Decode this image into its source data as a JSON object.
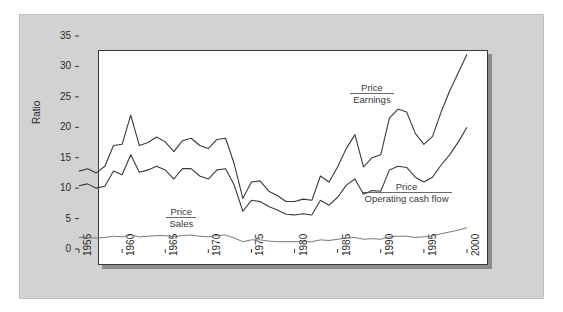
{
  "chart_data": {
    "type": "line",
    "title": "",
    "xlabel": "",
    "ylabel": "Ratio",
    "xlim": [
      1955,
      2000
    ],
    "ylim": [
      0,
      35
    ],
    "grid": false,
    "legend_position": "inline-annotations",
    "yticks": [
      0,
      5,
      10,
      15,
      20,
      25,
      30,
      35
    ],
    "xticks": [
      1955,
      1960,
      1965,
      1970,
      1975,
      1980,
      1985,
      1990,
      1995,
      2000
    ],
    "x": [
      1955,
      1956,
      1957,
      1958,
      1959,
      1960,
      1961,
      1962,
      1963,
      1964,
      1965,
      1966,
      1967,
      1968,
      1969,
      1970,
      1971,
      1972,
      1973,
      1974,
      1975,
      1976,
      1977,
      1978,
      1979,
      1980,
      1981,
      1982,
      1983,
      1984,
      1985,
      1986,
      1987,
      1988,
      1989,
      1990,
      1991,
      1992,
      1993,
      1994,
      1995,
      1996,
      1997,
      1998,
      1999,
      2000
    ],
    "series": [
      {
        "name": "Price / Earnings",
        "label_numerator": "Price",
        "label_denominator": "Earnings",
        "color": "#3a3a3a",
        "values": [
          12.8,
          13.2,
          12.5,
          13.6,
          17.0,
          17.2,
          22.0,
          17.0,
          17.5,
          18.4,
          17.6,
          16.0,
          17.8,
          18.2,
          17.0,
          16.5,
          18.0,
          18.2,
          14.0,
          8.3,
          11.0,
          11.2,
          9.5,
          8.8,
          7.8,
          7.8,
          8.2,
          8.0,
          12.0,
          11.0,
          13.5,
          16.5,
          18.8,
          13.5,
          15.0,
          15.5,
          21.5,
          23.0,
          22.5,
          19.0,
          17.2,
          18.5,
          22.5,
          26.0,
          29.0,
          32.0
        ]
      },
      {
        "name": "Price / Operating cash flow",
        "label_numerator": "Price",
        "label_denominator": "Operating cash flow",
        "color": "#3a3a3a",
        "values": [
          10.4,
          10.7,
          10.0,
          10.3,
          12.8,
          12.2,
          15.5,
          12.6,
          13.0,
          13.6,
          13.0,
          11.5,
          13.2,
          13.2,
          12.0,
          11.5,
          13.0,
          13.2,
          10.5,
          6.2,
          8.0,
          7.8,
          7.0,
          6.4,
          5.7,
          5.6,
          5.8,
          5.6,
          8.0,
          7.2,
          8.5,
          10.5,
          11.5,
          9.0,
          9.6,
          9.5,
          13.0,
          13.6,
          13.4,
          11.8,
          11.0,
          11.8,
          13.8,
          15.5,
          17.6,
          20.0
        ]
      },
      {
        "name": "Price / Sales",
        "label_numerator": "Price",
        "label_denominator": "Sales",
        "color": "#6a6a6a",
        "values": [
          1.9,
          1.9,
          1.8,
          1.9,
          2.1,
          2.0,
          2.3,
          2.0,
          2.1,
          2.2,
          2.2,
          2.0,
          2.2,
          2.3,
          2.1,
          2.0,
          2.2,
          2.3,
          1.8,
          1.2,
          1.5,
          1.5,
          1.3,
          1.2,
          1.2,
          1.2,
          1.2,
          1.2,
          1.5,
          1.4,
          1.6,
          1.8,
          1.9,
          1.6,
          1.7,
          1.6,
          2.0,
          2.1,
          2.1,
          1.9,
          2.0,
          2.2,
          2.5,
          2.8,
          3.1,
          3.5
        ]
      }
    ],
    "annotations": [
      {
        "id": "pe",
        "numerator": "Price",
        "denominator": "Earnings"
      },
      {
        "id": "pocf",
        "numerator": "Price",
        "denominator": "Operating cash flow"
      },
      {
        "id": "ps",
        "numerator": "Price",
        "denominator": "Sales"
      }
    ]
  }
}
